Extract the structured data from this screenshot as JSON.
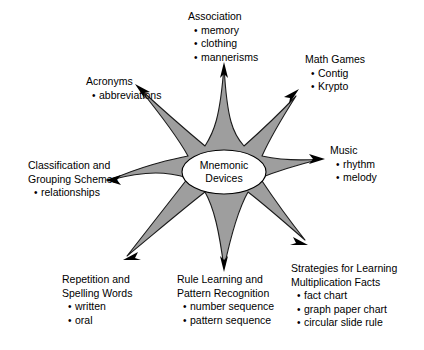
{
  "diagram": {
    "type": "radial-star-concept-map",
    "center": {
      "label_line1": "Mnemonic",
      "label_line2": "Devices",
      "shape": "eight-point-star",
      "star_fill": "#9e9e9e",
      "star_stroke": "#1a1a1a",
      "center_ellipse_fill": "#ffffff",
      "center_ellipse_stroke": "#000000"
    },
    "background": "#ffffff",
    "arrow_color": "#000000",
    "nodes": [
      {
        "id": "association",
        "title": "Association",
        "items": [
          "memory",
          "clothing",
          "mannerisms"
        ],
        "direction": "up"
      },
      {
        "id": "math-games",
        "title": "Math Games",
        "items": [
          "Contig",
          "Krypto"
        ],
        "direction": "up-right"
      },
      {
        "id": "music",
        "title": "Music",
        "items": [
          "rhythm",
          "melody"
        ],
        "direction": "right"
      },
      {
        "id": "strategies",
        "title_line1": "Strategies for Learning",
        "title_line2": "Multiplication Facts",
        "items": [
          "fact chart",
          "graph paper chart",
          "circular slide rule"
        ],
        "direction": "down-right"
      },
      {
        "id": "rule-learning",
        "title_line1": "Rule Learning and",
        "title_line2": "Pattern Recognition",
        "items": [
          "number sequence",
          "pattern sequence"
        ],
        "direction": "down"
      },
      {
        "id": "repetition",
        "title_line1": "Repetition and",
        "title_line2": "Spelling Words",
        "items": [
          "written",
          "oral"
        ],
        "direction": "down-left"
      },
      {
        "id": "classification",
        "title_line1": "Classification and",
        "title_line2": "Grouping Schemes",
        "items": [
          "relationships"
        ],
        "direction": "left"
      },
      {
        "id": "acronyms",
        "title": "Acronyms",
        "items": [
          "abbreviations"
        ],
        "direction": "up-left"
      }
    ]
  }
}
